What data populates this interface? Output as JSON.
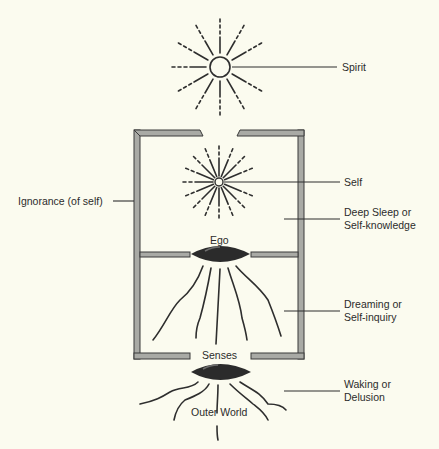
{
  "diagram": {
    "labels": {
      "spirit": "Spirit",
      "self": "Self",
      "ignorance": "Ignorance (of self)",
      "deep_sleep_1": "Deep Sleep or",
      "deep_sleep_2": "Self-knowledge",
      "ego": "Ego",
      "dreaming_1": "Dreaming or",
      "dreaming_2": "Self-inquiry",
      "senses": "Senses",
      "waking_1": "Waking or",
      "waking_2": "Delusion",
      "outer_world": "Outer World"
    },
    "colors": {
      "background": "#fbfbef",
      "wall_fill": "#a9aaa5",
      "line": "#2e2e2e",
      "lens": "#2b2b2b"
    }
  }
}
